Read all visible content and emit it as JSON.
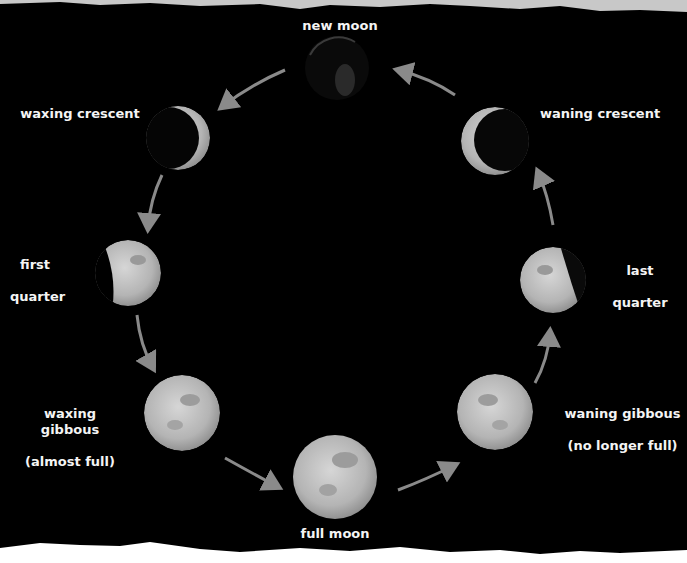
{
  "diagram": {
    "colors": {
      "background": "#000000",
      "arrow": "#8a8a8a",
      "label": "#f4f4f4",
      "paper": "#c8c8c8"
    },
    "phases": [
      {
        "id": "new-moon",
        "label": "new moon",
        "label_line2": ""
      },
      {
        "id": "waxing-crescent",
        "label": "waxing crescent",
        "label_line2": ""
      },
      {
        "id": "first-quarter",
        "label": "first",
        "label_line2": "quarter"
      },
      {
        "id": "waxing-gibbous",
        "label": "waxing gibbous",
        "label_line2": "(almost full)"
      },
      {
        "id": "full-moon",
        "label": "full moon",
        "label_line2": ""
      },
      {
        "id": "waning-gibbous",
        "label": "waning gibbous",
        "label_line2": "(no longer full)"
      },
      {
        "id": "last-quarter",
        "label": "last",
        "label_line2": "quarter"
      },
      {
        "id": "waning-crescent",
        "label": "waning crescent",
        "label_line2": ""
      }
    ],
    "cycle_direction": "counter-clockwise"
  }
}
